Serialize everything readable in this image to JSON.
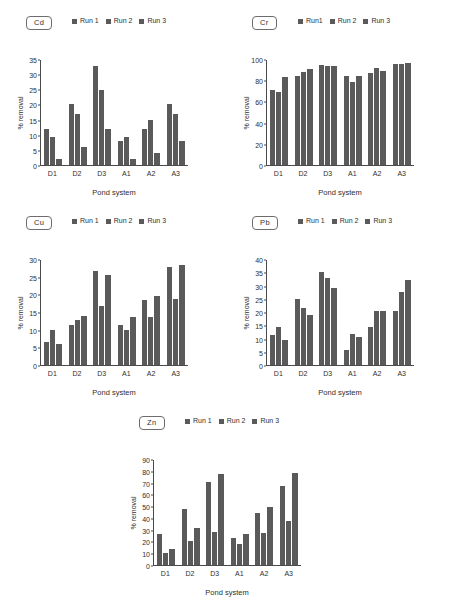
{
  "figure": {
    "ylabel": "% removal",
    "xlabel": "Pond system",
    "categories": [
      "D1",
      "D2",
      "D3",
      "A1",
      "A2",
      "A3"
    ]
  },
  "chart_data": [
    {
      "type": "bar",
      "title": "Cd",
      "panel_label": "Cd",
      "xlabel": "Pond system",
      "ylabel": "% removal",
      "categories": [
        "D1",
        "D2",
        "D3",
        "A1",
        "A2",
        "A3"
      ],
      "ylim": [
        0,
        35
      ],
      "ytick_step": 5,
      "yticks": [
        0,
        5,
        10,
        15,
        20,
        25,
        30,
        35
      ],
      "grid": false,
      "legend_position": "top-center",
      "legend": [
        "Run 1",
        "Run 2",
        "Run 3"
      ],
      "series": [
        {
          "name": "Run 1",
          "values": [
            12,
            20.5,
            33,
            8,
            12,
            20.5
          ]
        },
        {
          "name": "Run 2",
          "values": [
            9.5,
            17,
            25,
            9.5,
            15,
            17
          ]
        },
        {
          "name": "Run 3",
          "values": [
            2,
            6,
            12,
            2,
            4,
            8
          ]
        }
      ]
    },
    {
      "type": "bar",
      "title": "Cr",
      "panel_label": "Cr",
      "xlabel": "Pond system",
      "ylabel": "% removal",
      "categories": [
        "D1",
        "D2",
        "D3",
        "A1",
        "A2",
        "A3"
      ],
      "ylim": [
        0,
        100
      ],
      "ytick_step": 20,
      "yticks": [
        0,
        20,
        40,
        60,
        80,
        100
      ],
      "grid": false,
      "legend_position": "top-center",
      "legend": [
        "Run1",
        "Run 2",
        "Run 3"
      ],
      "series": [
        {
          "name": "Run1",
          "values": [
            71,
            85,
            95,
            85,
            88,
            96
          ]
        },
        {
          "name": "Run 2",
          "values": [
            70,
            89,
            94,
            79,
            92,
            96
          ]
        },
        {
          "name": "Run 3",
          "values": [
            84,
            91,
            94,
            85,
            90,
            97
          ]
        }
      ]
    },
    {
      "type": "bar",
      "title": "Cu",
      "panel_label": "Cu",
      "xlabel": "Pond system",
      "ylabel": "% removal",
      "categories": [
        "D1",
        "D2",
        "D3",
        "A1",
        "A2",
        "A3"
      ],
      "ylim": [
        0,
        30
      ],
      "ytick_step": 5,
      "yticks": [
        0,
        5,
        10,
        15,
        20,
        25,
        30
      ],
      "grid": false,
      "legend_position": "top-center",
      "legend": [
        "Run 1",
        "Run 2",
        "Run 3"
      ],
      "series": [
        {
          "name": "Run 1",
          "values": [
            6.7,
            11.4,
            27,
            11.5,
            18.6,
            27.9
          ]
        },
        {
          "name": "Run 2",
          "values": [
            10,
            12.9,
            16.8,
            10,
            13.8,
            18.8
          ]
        },
        {
          "name": "Run 3",
          "values": [
            5.9,
            13.9,
            25.8,
            13.8,
            19.6,
            28.5
          ]
        }
      ]
    },
    {
      "type": "bar",
      "title": "Pb",
      "panel_label": "Pb",
      "xlabel": "Pond system",
      "ylabel": "% removal",
      "categories": [
        "D1",
        "D2",
        "D3",
        "A1",
        "A2",
        "A3"
      ],
      "ylim": [
        0,
        40
      ],
      "ytick_step": 5,
      "yticks": [
        0,
        5,
        10,
        15,
        20,
        25,
        30,
        35,
        40
      ],
      "grid": false,
      "legend_position": "top-center",
      "legend": [
        "Run 1",
        "Run 2",
        "Run 3"
      ],
      "series": [
        {
          "name": "Run 1",
          "values": [
            11.5,
            25.2,
            35.5,
            5.7,
            14.6,
            20.4
          ]
        },
        {
          "name": "Run 2",
          "values": [
            14.6,
            21.6,
            33.2,
            11.8,
            20.7,
            28
          ]
        },
        {
          "name": "Run 3",
          "values": [
            9.6,
            19,
            29.2,
            10.5,
            20.5,
            32.5
          ]
        }
      ]
    },
    {
      "type": "bar",
      "title": "Zn",
      "panel_label": "Zn",
      "xlabel": "Pond system",
      "ylabel": "% removal",
      "categories": [
        "D1",
        "D2",
        "D3",
        "A1",
        "A2",
        "A3"
      ],
      "ylim": [
        0,
        90
      ],
      "ytick_step": 10,
      "yticks": [
        0,
        10,
        20,
        30,
        40,
        50,
        60,
        70,
        80,
        90
      ],
      "grid": false,
      "legend_position": "top-center",
      "legend": [
        "Run 1",
        "Run 2",
        "Run 3"
      ],
      "series": [
        {
          "name": "Run 1",
          "values": [
            26.5,
            48,
            71.5,
            23.5,
            44.5,
            68
          ]
        },
        {
          "name": "Run 2",
          "values": [
            10.5,
            20.5,
            28,
            18,
            27.5,
            37.5
          ]
        },
        {
          "name": "Run 3",
          "values": [
            14,
            31.5,
            78,
            26.5,
            50,
            79
          ]
        }
      ]
    }
  ],
  "colors": {
    "bar": "#5a5a5a",
    "axis": "#4a4a4a",
    "text": "#2e2e2e",
    "background": "#ffffff"
  }
}
